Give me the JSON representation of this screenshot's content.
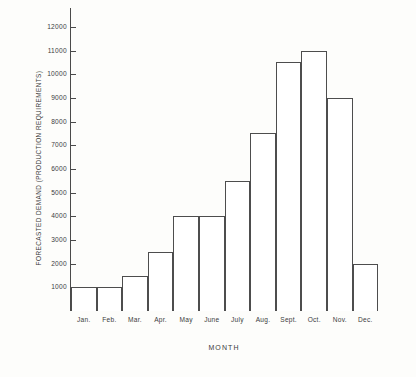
{
  "chart_data": {
    "type": "bar",
    "title": "",
    "xlabel": "MONTH",
    "ylabel": "FORECASTED DEMAND  (PRODUCTION REQUIREMENTS)",
    "categories": [
      "Jan.",
      "Feb.",
      "Mar.",
      "Apr.",
      "May",
      "June",
      "July",
      "Aug.",
      "Sept.",
      "Oct.",
      "Nov.",
      "Dec."
    ],
    "values": [
      1000,
      1000,
      1500,
      2500,
      4000,
      4000,
      5500,
      7500,
      10500,
      11000,
      9000,
      2000
    ],
    "ylim": [
      0,
      12800
    ],
    "ytick_values": [
      1000,
      2000,
      3000,
      4000,
      5000,
      6000,
      7000,
      8000,
      9000,
      10000,
      11000,
      12000
    ],
    "ytick_labels": [
      "1000",
      "2000",
      "3000",
      "4000",
      "5000",
      "6000",
      "7000",
      "8000",
      "9000",
      "10000",
      "11000",
      "12000"
    ],
    "grid": false,
    "legend": null,
    "bar_fill": "#ffffff",
    "bar_edge_color": "#4d4d4d",
    "axis_color": "#4a4a4a",
    "background": "#fdfdfb"
  }
}
